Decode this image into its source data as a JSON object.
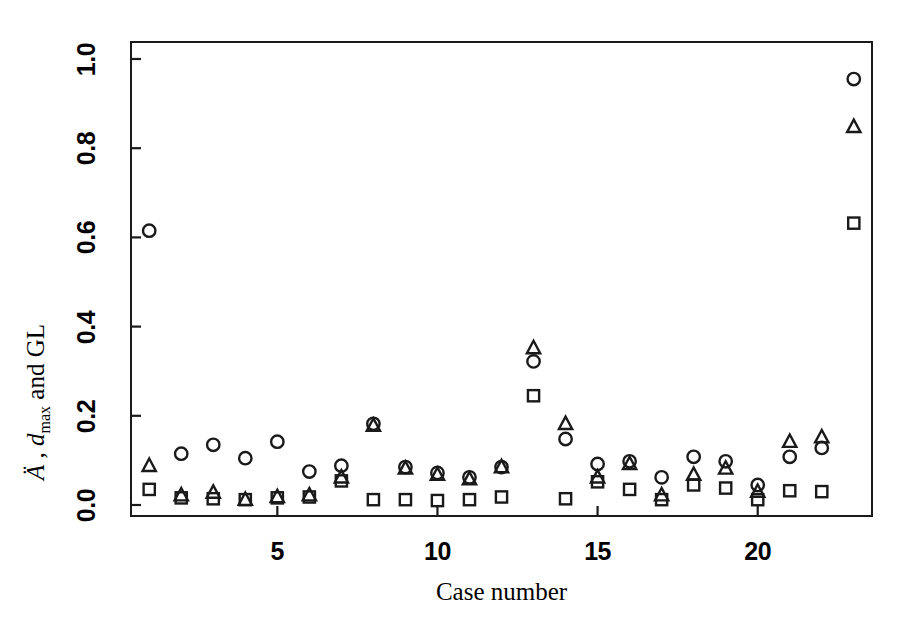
{
  "chart_data": {
    "type": "scatter",
    "title": "",
    "xlabel": "Case number",
    "ylabel_parts": {
      "a_umlaut": "Ä",
      "comma": " , ",
      "d": "d",
      "sub": "max",
      "tail": " and GL"
    },
    "ylabel": "Ä , d max and GL",
    "xlim": [
      0.4,
      23.6
    ],
    "ylim": [
      0.0,
      1.0
    ],
    "xticks": [
      5,
      10,
      15,
      20
    ],
    "yticks": [
      0.0,
      0.2,
      0.4,
      0.6,
      0.8,
      1.0
    ],
    "ytick_labels": [
      "0.0",
      "0.2",
      "0.4",
      "0.6",
      "0.8",
      "1.0"
    ],
    "xtick_labels": [
      "5",
      "10",
      "15",
      "20"
    ],
    "grid": false,
    "legend": "none",
    "marker_color": "#1a1a1a",
    "x": [
      1,
      2,
      3,
      4,
      5,
      6,
      7,
      8,
      9,
      10,
      11,
      12,
      13,
      14,
      15,
      16,
      17,
      18,
      19,
      20,
      21,
      22,
      23
    ],
    "series": [
      {
        "name": "Ä",
        "marker": "circle",
        "values": [
          0.615,
          0.115,
          0.135,
          0.105,
          0.142,
          0.075,
          0.088,
          0.182,
          0.085,
          0.072,
          0.062,
          0.085,
          0.322,
          0.148,
          0.092,
          0.098,
          0.062,
          0.108,
          0.098,
          0.045,
          0.108,
          0.128,
          0.955
        ]
      },
      {
        "name": "d max",
        "marker": "triangle",
        "values": [
          0.088,
          0.022,
          0.028,
          0.012,
          0.018,
          0.022,
          0.062,
          0.178,
          0.082,
          0.068,
          0.058,
          0.085,
          0.352,
          0.182,
          0.062,
          0.092,
          0.022,
          0.068,
          0.082,
          0.03,
          0.142,
          0.152,
          0.848
        ]
      },
      {
        "name": "GL",
        "marker": "square",
        "values": [
          0.035,
          0.016,
          0.014,
          0.012,
          0.016,
          0.018,
          0.054,
          0.012,
          0.012,
          0.01,
          0.012,
          0.018,
          0.245,
          0.014,
          0.052,
          0.035,
          0.012,
          0.045,
          0.038,
          0.012,
          0.032,
          0.03,
          0.632
        ]
      }
    ]
  },
  "axes": {
    "x_tick_title": "Case number",
    "y_axis_caption": "Ä , d max and GL"
  }
}
